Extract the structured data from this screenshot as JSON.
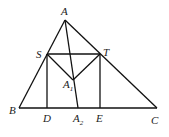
{
  "diagram": {
    "points": {
      "A": {
        "label": "A",
        "sub": "",
        "x": 65,
        "y": 20
      },
      "S": {
        "label": "S",
        "sub": "",
        "x": 47,
        "y": 54
      },
      "T": {
        "label": "T",
        "sub": "",
        "x": 100,
        "y": 54
      },
      "A1": {
        "label": "A",
        "sub": "1",
        "x": 73,
        "y": 80
      },
      "B": {
        "label": "B",
        "sub": "",
        "x": 19,
        "y": 108
      },
      "D": {
        "label": "D",
        "sub": "",
        "x": 47,
        "y": 108
      },
      "A2": {
        "label": "A",
        "sub": "2",
        "x": 78,
        "y": 108
      },
      "E": {
        "label": "E",
        "sub": "",
        "x": 100,
        "y": 108
      },
      "C": {
        "label": "C",
        "sub": "",
        "x": 157,
        "y": 108
      }
    },
    "segments": [
      [
        "A",
        "B"
      ],
      [
        "A",
        "C"
      ],
      [
        "B",
        "C"
      ],
      [
        "S",
        "T"
      ],
      [
        "S",
        "D"
      ],
      [
        "T",
        "E"
      ],
      [
        "S",
        "A1"
      ],
      [
        "T",
        "A1"
      ],
      [
        "A",
        "A2"
      ]
    ],
    "line_color": "#111111"
  }
}
